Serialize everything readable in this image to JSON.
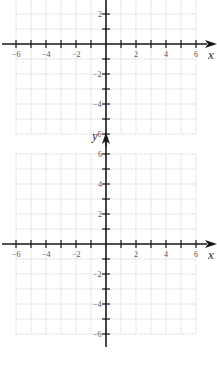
{
  "graphs": [
    {
      "id": "top",
      "x_axis_label": "x",
      "y_axis_label": "",
      "x_range": [
        -6,
        6
      ],
      "y_range": [
        -6,
        6
      ],
      "x_tick_labels": [
        "-6",
        "-4",
        "-2",
        "2",
        "4",
        "6"
      ],
      "y_tick_labels": [
        "2",
        "-2",
        "-4",
        "-6"
      ],
      "cropped_top": true
    },
    {
      "id": "bottom",
      "x_axis_label": "x",
      "y_axis_label": "y",
      "x_range": [
        -6,
        6
      ],
      "y_range": [
        -6,
        6
      ],
      "x_tick_labels": [
        "-6",
        "-4",
        "-2",
        "2",
        "4",
        "6"
      ],
      "y_tick_labels": [
        "6",
        "4",
        "2",
        "-2",
        "-4",
        "-6"
      ]
    }
  ],
  "chart_data": [
    {
      "type": "grid",
      "title": "",
      "xlabel": "x",
      "ylabel": "",
      "xlim": [
        -6,
        6
      ],
      "ylim": [
        -6,
        6
      ],
      "grid": true,
      "x_ticks": [
        -6,
        -4,
        -2,
        2,
        4,
        6
      ],
      "y_ticks": [
        2,
        -2,
        -4,
        -6
      ],
      "series": []
    },
    {
      "type": "grid",
      "title": "",
      "xlabel": "x",
      "ylabel": "y",
      "xlim": [
        -6,
        6
      ],
      "ylim": [
        -6,
        6
      ],
      "grid": true,
      "x_ticks": [
        -6,
        -4,
        -2,
        2,
        4,
        6
      ],
      "y_ticks": [
        6,
        4,
        2,
        -2,
        -4,
        -6
      ],
      "series": []
    }
  ]
}
